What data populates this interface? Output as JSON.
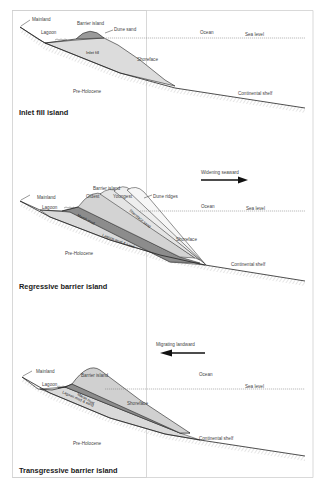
{
  "panels": [
    {
      "title": "Inlet fill island",
      "labels": {
        "mainland": "Mainland",
        "lagoon": "Lagoon",
        "barrier_island": "Barrier island",
        "dune_sand": "Dune sand",
        "ocean": "Ocean",
        "sea_level": "Sea level",
        "inlet_fill": "Inlet fill",
        "shoreface": "Shoreface",
        "pre_holocene": "Pre-Holocene",
        "continental_shelf": "Continental shelf"
      }
    },
    {
      "title": "Regressive barrier island",
      "arrow_label": "Widening seaward",
      "arrow_direction": "right",
      "labels": {
        "mainland": "Mainland",
        "lagoon": "Lagoon",
        "barrier_island": "Barrier island",
        "oldest": "Oldest",
        "youngest": "Youngest",
        "dune_ridges": "Dune ridges",
        "ocean": "Ocean",
        "sea_level": "Sea level",
        "marsh_mud": "Marsh mud",
        "shoreface_sand": "Shoreface sand",
        "lagoon_mud_sand": "Lagoon mud & sand",
        "shoreface": "Shoreface",
        "pre_holocene": "Pre-Holocene",
        "continental_shelf": "Continental shelf"
      }
    },
    {
      "title": "Transgressive barrier island",
      "arrow_label": "Migrating landward",
      "arrow_direction": "left",
      "labels": {
        "mainland": "Mainland",
        "lagoon": "Lagoon",
        "barrier_island": "Barrier island",
        "ocean": "Ocean",
        "sea_level": "Sea level",
        "marsh_mud": "Marsh mud",
        "lagoon_mud_sand": "Lagoon mud & sand",
        "shoreface": "Shoreface",
        "pre_holocene": "Pre-Holocene",
        "continental_shelf": "Continental shelf"
      }
    }
  ],
  "colors": {
    "outline": "#222222",
    "light_fill": "#d9d9d9",
    "mid_fill": "#bdbdbd",
    "dark_fill": "#8c8c8c",
    "dune_fill": "#9a9a9a",
    "hatch": "#b0b0b0",
    "frame": "#c8c8c8"
  }
}
